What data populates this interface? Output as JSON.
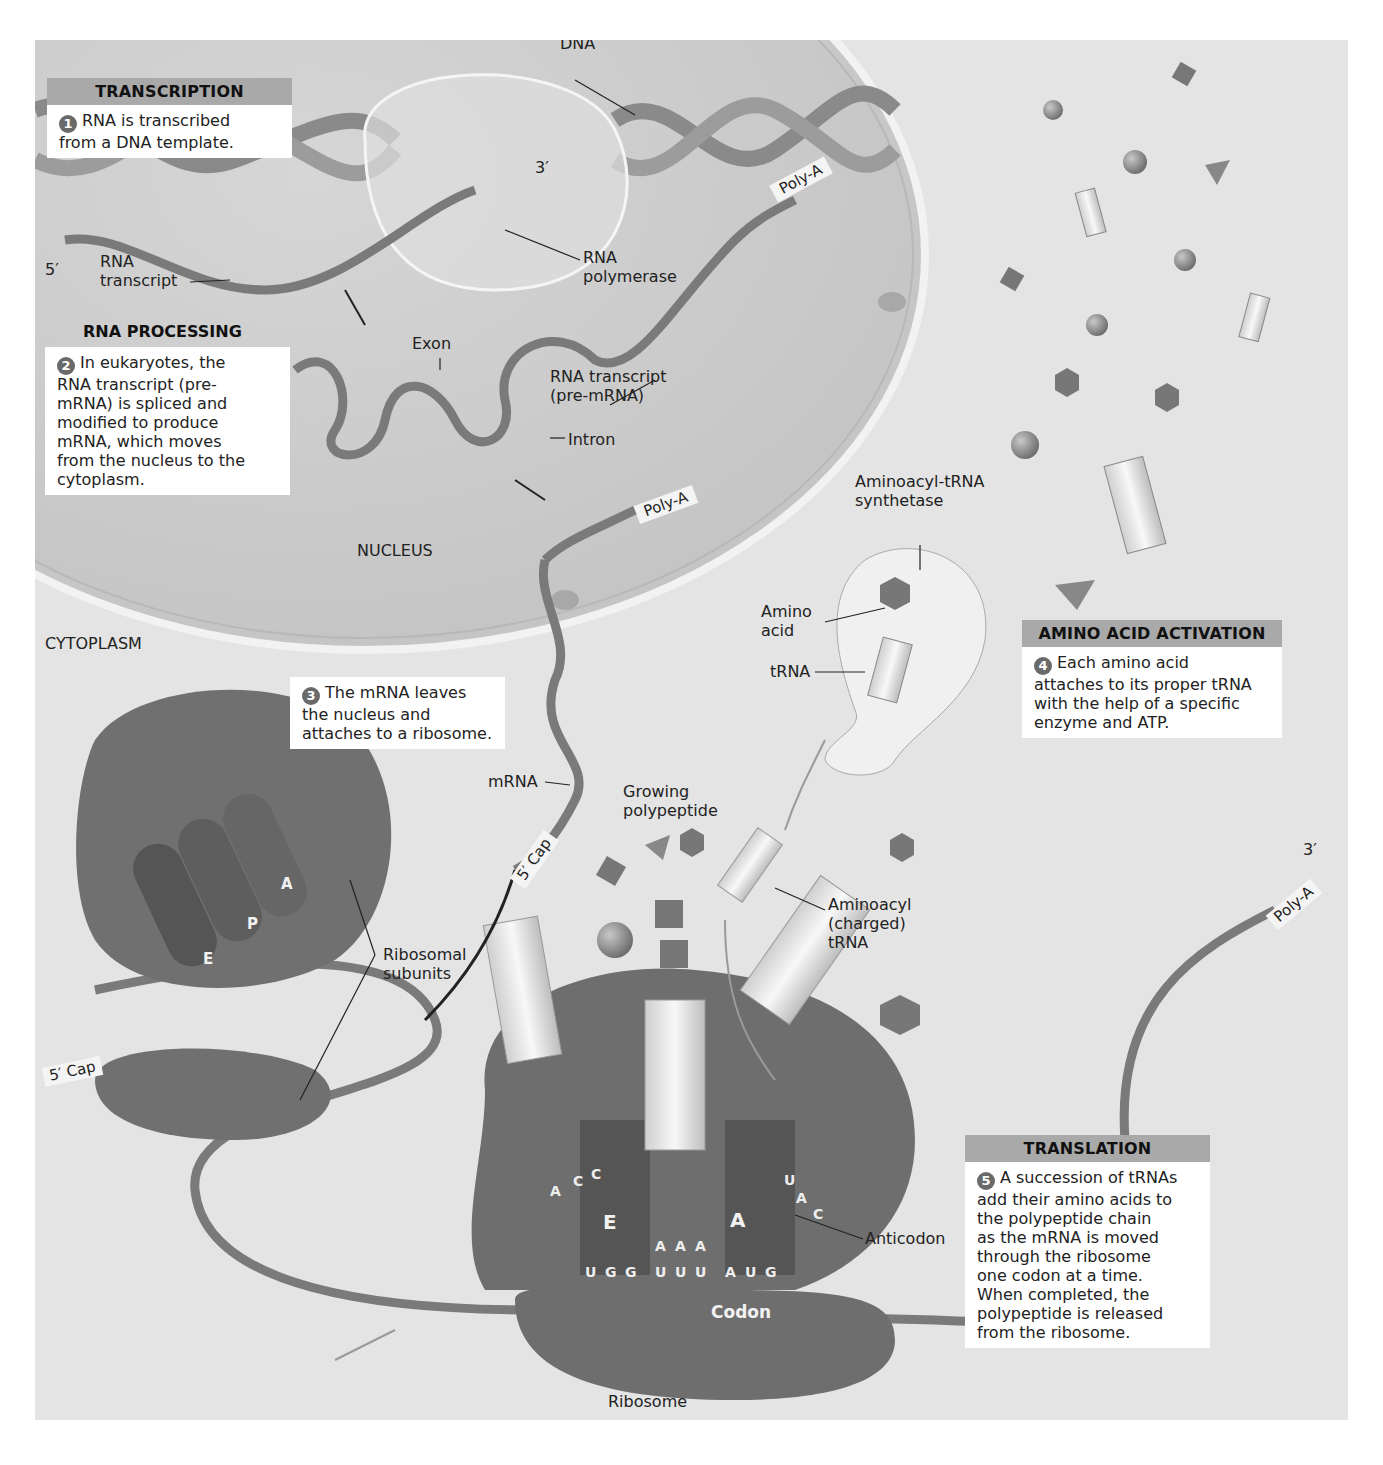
{
  "steps": [
    {
      "section": "TRANSCRIPTION",
      "number": "1",
      "text": "RNA is transcribed\nfrom a DNA template."
    },
    {
      "section": "RNA PROCESSING",
      "number": "2",
      "text": "In eukaryotes, the\nRNA transcript (pre-\nmRNA) is spliced and\nmodified to produce\nmRNA, which moves\nfrom the nucleus to the\ncytoplasm."
    },
    {
      "section": "",
      "number": "3",
      "text": "The mRNA leaves\nthe nucleus and\nattaches to a ribosome."
    },
    {
      "section": "AMINO ACID ACTIVATION",
      "number": "4",
      "text": "Each amino acid\nattaches to its proper tRNA\nwith the help of a specific\nenzyme and ATP."
    },
    {
      "section": "TRANSLATION",
      "number": "5",
      "text": "A succession of tRNAs\nadd their amino acids to\nthe polypeptide chain\nas the mRNA is moved\nthrough the ribosome\none codon at a time.\nWhen completed, the\npolypeptide is released\nfrom the ribosome."
    }
  ],
  "labels": {
    "dna": "DNA",
    "three_prime_dna": "3′",
    "five_prime": "5′",
    "rna_transcript": "RNA\ntranscript",
    "rna_polymerase": "RNA\npolymerase",
    "poly_a": "Poly-A",
    "exon": "Exon",
    "rna_transcript_pre": "RNA transcript\n(pre-mRNA)",
    "intron": "Intron",
    "nucleus": "NUCLEUS",
    "cytoplasm": "CYTOPLASM",
    "aminoacyl_trna_synthetase": "Aminoacyl-tRNA\nsynthetase",
    "amino_acid": "Amino\nacid",
    "trna": "tRNA",
    "mrna": "mRNA",
    "five_cap": "5′ Cap",
    "growing_polypeptide": "Growing\npolypeptide",
    "aminoacyl_charged_trna": "Aminoacyl\n(charged)\ntRNA",
    "three_prime_end": "3′",
    "ribosomal_subunits": "Ribosomal\nsubunits",
    "ribosome": "Ribosome",
    "anticodon": "Anticodon",
    "codon": "Codon",
    "sites": {
      "e": "E",
      "p": "P",
      "a": "A"
    }
  },
  "sequences": {
    "mrna_bases": [
      "U",
      "G",
      "G",
      "U",
      "U",
      "U",
      "A",
      "U",
      "G"
    ],
    "p_site_anticodon": [
      "A",
      "A",
      "A"
    ],
    "e_site_anticodon": [
      "A",
      "C",
      "C"
    ],
    "a_site_anticodon": [
      "U",
      "A",
      "C"
    ]
  },
  "colors": {
    "background": "#e4e4e4",
    "nucleus": "#d0d0d0",
    "ribosome": "#6e6e6e",
    "header": "#a9a9a9",
    "trna": "#f0f0f0"
  }
}
